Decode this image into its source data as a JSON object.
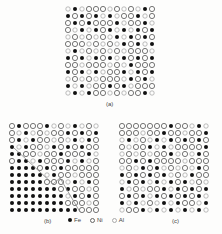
{
  "figure": {
    "panels": [
      {
        "id": "a",
        "label": "(a)",
        "rows": 13,
        "cols": 13,
        "x": 68,
        "y": 9,
        "pitch": 7,
        "seed": 1,
        "boundary_line": false
      },
      {
        "id": "b",
        "label": "(b)",
        "rows": 13,
        "cols": 13,
        "x": 12,
        "y": 126,
        "pitch": 7,
        "seed": 2,
        "boundary_line": true
      },
      {
        "id": "c",
        "label": "(c)",
        "rows": 13,
        "cols": 13,
        "x": 122,
        "y": 126,
        "pitch": 7,
        "seed": 3,
        "boundary_line": false
      }
    ],
    "legend": [
      {
        "symbol": "filled-circle",
        "label": "Fe",
        "color": "#111111"
      },
      {
        "symbol": "open-circle",
        "label": "Ni",
        "color": "#666666"
      },
      {
        "symbol": "open-circle-light",
        "label": "Al",
        "color": "#aaaaaa"
      }
    ]
  },
  "colors": {
    "background": "#fdfdfc",
    "fe": "#111111",
    "ni": "#666666",
    "al": "#aaaaaa",
    "line": "#888888"
  }
}
